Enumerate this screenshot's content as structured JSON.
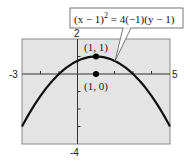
{
  "chart_data": {
    "type": "line",
    "title": "",
    "equation": {
      "text_base": "(x − 1)",
      "exponent": "2",
      "text_rest": " = 4(−1)(y − 1)"
    },
    "xlabel": "",
    "ylabel": "",
    "xlim": [
      -3,
      5
    ],
    "ylim": [
      -4,
      2
    ],
    "grid": false,
    "x_tick_labels": {
      "min": "-3",
      "max": "5"
    },
    "y_tick_labels": {
      "max": "2",
      "min": "-4"
    },
    "x_ticks": [
      -3,
      -2,
      -1,
      0,
      1,
      2,
      3,
      4,
      5
    ],
    "y_ticks": [
      -4,
      -3,
      -2,
      -1,
      0,
      1,
      2
    ],
    "series": [
      {
        "name": "parabola",
        "equation": "(x-1)^2 = 4(-1)(y-1)",
        "x": [
          -3,
          -2,
          -1,
          0,
          1,
          2,
          3,
          4,
          5
        ],
        "y": [
          -3,
          -1.25,
          0,
          0.75,
          1,
          0.75,
          0,
          -1.25,
          -3
        ]
      }
    ],
    "points": [
      {
        "label": "(1, 1)",
        "x": 1,
        "y": 1,
        "role": "vertex"
      },
      {
        "label": "(1, 0)",
        "x": 1,
        "y": 0,
        "role": "focus"
      }
    ],
    "colors": {
      "plot_bg": "#e4e4e4",
      "curve": "#111111",
      "axis": "#333333"
    }
  }
}
